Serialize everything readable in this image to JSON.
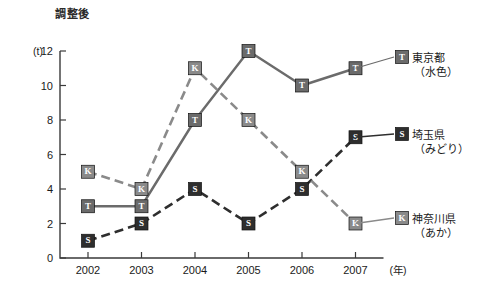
{
  "chart_data": {
    "type": "line",
    "title": "調整後",
    "xlabel": "(年)",
    "ylabel": "(t)",
    "categories": [
      "2002",
      "2003",
      "2004",
      "2005",
      "2006",
      "2007"
    ],
    "ylim": [
      0,
      12
    ],
    "yticks": [
      0,
      2,
      4,
      6,
      8,
      10,
      12
    ],
    "grid": false,
    "legend_position": "right",
    "series": [
      {
        "name": "東京都",
        "sub": "（水色）",
        "marker": "T",
        "style": "solid",
        "color": "#6b6b6b",
        "values": [
          3,
          3,
          8,
          12,
          10,
          11
        ]
      },
      {
        "name": "埼玉県",
        "sub": "（みどり）",
        "marker": "S",
        "style": "dashed",
        "color": "#2e2e2e",
        "values": [
          1,
          2,
          4,
          2,
          4,
          7
        ]
      },
      {
        "name": "神奈川県",
        "sub": "（あか）",
        "marker": "K",
        "style": "dashed",
        "color": "#8a8a8a",
        "values": [
          5,
          4,
          11,
          8,
          5,
          2
        ]
      }
    ]
  },
  "legend": [
    {
      "name": "東京都",
      "sub": "（水色）",
      "marker": "T"
    },
    {
      "name": "埼玉県",
      "sub": "（みどり）",
      "marker": "S"
    },
    {
      "name": "神奈川県",
      "sub": "（あか）",
      "marker": "K"
    }
  ]
}
